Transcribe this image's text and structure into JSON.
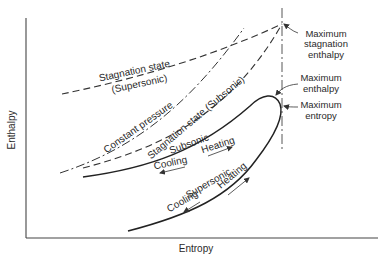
{
  "diagram": {
    "axes": {
      "x_label": "Entropy",
      "y_label": "Enthalpy"
    },
    "curves": {
      "stagnation_supersonic": {
        "line1": "Stagnation state",
        "line2": "(Supersonic)"
      },
      "constant_pressure": "Constant pressure",
      "stagnation_subsonic": "Stagnation state (Subsonic)",
      "subsonic_branch": "Subsonic",
      "supersonic_branch": "Supersonic"
    },
    "process_labels": {
      "subsonic_cooling": "Cooling",
      "subsonic_heating": "Heating",
      "supersonic_cooling": "Cooling",
      "supersonic_heating": "Heating"
    },
    "annotations": {
      "max_stagnation_enthalpy": [
        "Maximum",
        "stagnation",
        "enthalpy"
      ],
      "max_enthalpy": [
        "Maximum",
        "enthalpy"
      ],
      "max_entropy": [
        "Maximum",
        "entropy"
      ]
    }
  }
}
